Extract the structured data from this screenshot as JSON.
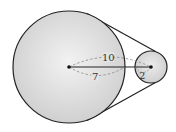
{
  "diagram": {
    "big_circle": {
      "cx": 69,
      "cy": 67,
      "r": 56,
      "fill": "#d9d9d9",
      "stroke": "#222222"
    },
    "small_circle": {
      "cx": 151,
      "cy": 67,
      "r": 16,
      "fill": "#d6d6d6",
      "stroke": "#222222"
    },
    "labels": {
      "center_distance": "10",
      "big_radius": "7",
      "small_radius": "2"
    },
    "colors": {
      "outline": "#222222",
      "dashed": "#888888",
      "fill_light": "#eeeeee",
      "fill_dark": "#cfcfcf"
    }
  }
}
